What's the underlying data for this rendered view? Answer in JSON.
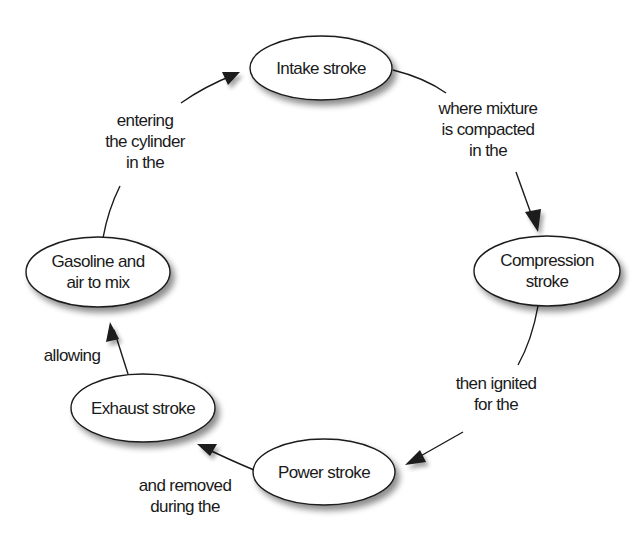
{
  "diagram": {
    "type": "cycle",
    "colors": {
      "stroke": "#1a1a1a",
      "fill": "#ffffff",
      "shadow": "#9a9a9a",
      "text": "#1a1a1a"
    },
    "nodes": [
      {
        "id": "intake",
        "lines": [
          "Intake stroke"
        ]
      },
      {
        "id": "compression",
        "lines": [
          "Compression",
          "stroke"
        ]
      },
      {
        "id": "power",
        "lines": [
          "Power stroke"
        ]
      },
      {
        "id": "exhaust",
        "lines": [
          "Exhaust stroke"
        ]
      },
      {
        "id": "gasoline",
        "lines": [
          "Gasoline and",
          "air to mix"
        ]
      }
    ],
    "edges": [
      {
        "from": "intake",
        "to": "compression",
        "lines": [
          "where mixture",
          "is compacted",
          "in the"
        ]
      },
      {
        "from": "compression",
        "to": "power",
        "lines": [
          "then ignited",
          "for the"
        ]
      },
      {
        "from": "power",
        "to": "exhaust",
        "lines": [
          "and removed",
          "during the"
        ]
      },
      {
        "from": "exhaust",
        "to": "gasoline",
        "lines": [
          "allowing"
        ]
      },
      {
        "from": "gasoline",
        "to": "intake",
        "lines": [
          "entering",
          "the cylinder",
          "in the"
        ]
      }
    ]
  }
}
